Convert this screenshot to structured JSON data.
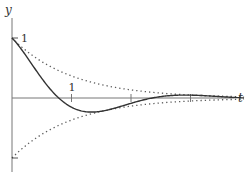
{
  "chart_data": {
    "type": "line",
    "title": "",
    "xlabel": "t",
    "ylabel": "y",
    "xlim": [
      0,
      4.0
    ],
    "ylim": [
      -1.2,
      1.5
    ],
    "x_ticks": [
      1,
      2,
      3
    ],
    "x_tick_labels": [
      "1",
      "",
      ""
    ],
    "y_ticks": [
      1,
      -1
    ],
    "y_tick_labels": [
      "1",
      ""
    ],
    "grid": false,
    "legend": "none",
    "series": [
      {
        "name": "damped-oscillation",
        "formula": "e^{-t} cos(2t)",
        "style": "solid",
        "color": "#333333",
        "x": [
          0,
          0.25,
          0.5,
          0.785,
          1.0,
          1.25,
          1.5,
          1.75,
          2.0,
          2.36,
          2.75,
          3.0,
          3.5,
          3.9
        ],
        "y": [
          1.0,
          0.683,
          0.328,
          0.0,
          -0.153,
          -0.229,
          -0.221,
          -0.163,
          -0.089,
          0.0,
          0.045,
          0.048,
          0.021,
          -0.001
        ]
      },
      {
        "name": "upper-envelope",
        "formula": "e^{-t}",
        "style": "dotted",
        "color": "#333333",
        "x": [
          0,
          0.5,
          1.0,
          1.5,
          2.0,
          2.5,
          3.0,
          3.5,
          3.9
        ],
        "y": [
          1.0,
          0.607,
          0.368,
          0.223,
          0.135,
          0.082,
          0.05,
          0.03,
          0.02
        ]
      },
      {
        "name": "lower-envelope",
        "formula": "-e^{-t}",
        "style": "dotted",
        "color": "#333333",
        "x": [
          0,
          0.5,
          1.0,
          1.5,
          2.0,
          2.5,
          3.0,
          3.5,
          3.9
        ],
        "y": [
          -1.0,
          -0.607,
          -0.368,
          -0.223,
          -0.135,
          -0.082,
          -0.05,
          -0.03,
          -0.02
        ]
      }
    ]
  }
}
